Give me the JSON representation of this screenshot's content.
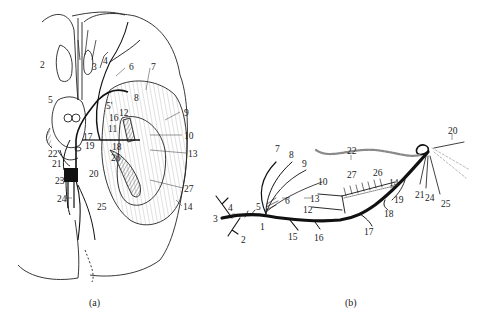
{
  "figure": {
    "panel_a": {
      "caption": "(a)",
      "labels": [
        {
          "id": "1",
          "text": "2",
          "x": 40,
          "y": 60
        },
        {
          "id": "2",
          "text": "3",
          "x": 92,
          "y": 62
        },
        {
          "id": "3",
          "text": "4",
          "x": 103,
          "y": 56
        },
        {
          "id": "4",
          "text": "6",
          "x": 129,
          "y": 62
        },
        {
          "id": "5",
          "text": "7",
          "x": 151,
          "y": 62
        },
        {
          "id": "6",
          "text": "5",
          "x": 48,
          "y": 95
        },
        {
          "id": "7",
          "text": "5'",
          "x": 106,
          "y": 101
        },
        {
          "id": "8",
          "text": "8",
          "x": 134,
          "y": 93
        },
        {
          "id": "9",
          "text": "12",
          "x": 119,
          "y": 108
        },
        {
          "id": "10",
          "text": "16",
          "x": 109,
          "y": 113
        },
        {
          "id": "11",
          "text": "11",
          "x": 108,
          "y": 124
        },
        {
          "id": "12",
          "text": "9",
          "x": 184,
          "y": 108
        },
        {
          "id": "13",
          "text": "10",
          "x": 184,
          "y": 131
        },
        {
          "id": "14",
          "text": "17",
          "x": 83,
          "y": 132
        },
        {
          "id": "15",
          "text": "19",
          "x": 85,
          "y": 141
        },
        {
          "id": "16",
          "text": "18",
          "x": 112,
          "y": 142
        },
        {
          "id": "17",
          "text": "13",
          "x": 188,
          "y": 149
        },
        {
          "id": "18",
          "text": "22",
          "x": 48,
          "y": 149
        },
        {
          "id": "19",
          "text": "21",
          "x": 52,
          "y": 159
        },
        {
          "id": "20",
          "text": "26",
          "x": 111,
          "y": 153
        },
        {
          "id": "21",
          "text": "23",
          "x": 55,
          "y": 176
        },
        {
          "id": "22",
          "text": "20",
          "x": 89,
          "y": 169
        },
        {
          "id": "23",
          "text": "27",
          "x": 184,
          "y": 184
        },
        {
          "id": "24",
          "text": "24",
          "x": 57,
          "y": 194
        },
        {
          "id": "25",
          "text": "25",
          "x": 97,
          "y": 202
        },
        {
          "id": "26",
          "text": "14",
          "x": 183,
          "y": 202
        }
      ]
    },
    "panel_b": {
      "caption": "(b)",
      "labels": [
        {
          "id": "1",
          "text": "22",
          "x": 347,
          "y": 146
        },
        {
          "id": "2",
          "text": "20",
          "x": 448,
          "y": 126
        },
        {
          "id": "3",
          "text": "7",
          "x": 275,
          "y": 144
        },
        {
          "id": "4",
          "text": "8",
          "x": 289,
          "y": 150
        },
        {
          "id": "5",
          "text": "9",
          "x": 302,
          "y": 159
        },
        {
          "id": "6",
          "text": "10",
          "x": 318,
          "y": 177
        },
        {
          "id": "7",
          "text": "27",
          "x": 347,
          "y": 170
        },
        {
          "id": "8",
          "text": "26",
          "x": 373,
          "y": 168
        },
        {
          "id": "9",
          "text": "14",
          "x": 389,
          "y": 178
        },
        {
          "id": "10",
          "text": "13",
          "x": 310,
          "y": 194
        },
        {
          "id": "11",
          "text": "6",
          "x": 285,
          "y": 196
        },
        {
          "id": "12",
          "text": "19",
          "x": 394,
          "y": 195
        },
        {
          "id": "13",
          "text": "21",
          "x": 415,
          "y": 190
        },
        {
          "id": "14",
          "text": "24",
          "x": 425,
          "y": 193
        },
        {
          "id": "15",
          "text": "25",
          "x": 441,
          "y": 199
        },
        {
          "id": "16",
          "text": "4",
          "x": 228,
          "y": 203
        },
        {
          "id": "17",
          "text": "5",
          "x": 256,
          "y": 202
        },
        {
          "id": "18",
          "text": "12",
          "x": 303,
          "y": 205
        },
        {
          "id": "19",
          "text": "18",
          "x": 384,
          "y": 209
        },
        {
          "id": "20",
          "text": "3",
          "x": 213,
          "y": 214
        },
        {
          "id": "21",
          "text": "1",
          "x": 260,
          "y": 222
        },
        {
          "id": "22",
          "text": "17",
          "x": 364,
          "y": 227
        },
        {
          "id": "23",
          "text": "2",
          "x": 241,
          "y": 235
        },
        {
          "id": "24",
          "text": "15",
          "x": 288,
          "y": 232
        },
        {
          "id": "25",
          "text": "16",
          "x": 314,
          "y": 233
        }
      ]
    }
  }
}
